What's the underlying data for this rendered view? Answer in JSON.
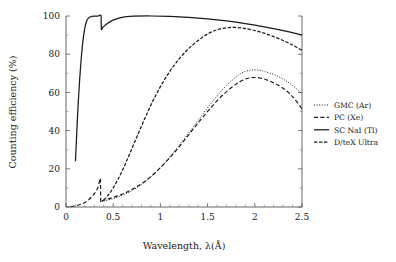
{
  "chart_data": {
    "type": "line",
    "title": "",
    "xlabel": "Wavelength, λ(Å)",
    "ylabel": "Counting efficiency (%)",
    "xlim": [
      0,
      2.5
    ],
    "ylim": [
      0,
      100
    ],
    "xticks": [
      "0",
      "0.5",
      "1",
      "1.5",
      "2",
      "2.5"
    ],
    "xtick_values": [
      0,
      0.5,
      1,
      1.5,
      2,
      2.5
    ],
    "yticks": [
      "0",
      "20",
      "40",
      "60",
      "80",
      "100"
    ],
    "ytick_values": [
      0,
      20,
      40,
      60,
      80,
      100
    ],
    "x_minor_step": 0.1,
    "y_minor_step": 10,
    "grid": false,
    "legend_position": "right-outside",
    "series": [
      {
        "name": "GMC (Ar)",
        "style": "dotted",
        "color": "#1a1a1a",
        "points": [
          [
            0.4,
            3.2
          ],
          [
            0.5,
            4.4
          ],
          [
            0.6,
            6.2
          ],
          [
            0.7,
            8.6
          ],
          [
            0.8,
            11.8
          ],
          [
            0.9,
            15.8
          ],
          [
            1.0,
            20.6
          ],
          [
            1.1,
            26.2
          ],
          [
            1.2,
            32.4
          ],
          [
            1.3,
            38.8
          ],
          [
            1.4,
            45.4
          ],
          [
            1.5,
            52.0
          ],
          [
            1.6,
            58.2
          ],
          [
            1.7,
            63.6
          ],
          [
            1.8,
            68.0
          ],
          [
            1.85,
            69.8
          ],
          [
            1.9,
            71.0
          ],
          [
            1.95,
            71.6
          ],
          [
            2.0,
            71.8
          ],
          [
            2.05,
            71.6
          ],
          [
            2.1,
            71.0
          ],
          [
            2.2,
            69.4
          ],
          [
            2.3,
            67.0
          ],
          [
            2.4,
            63.6
          ],
          [
            2.5,
            59.2
          ]
        ]
      },
      {
        "name": "PC (Xe)",
        "style": "dashed",
        "color": "#1a1a1a",
        "points": [
          [
            0.05,
            0.2
          ],
          [
            0.1,
            0.6
          ],
          [
            0.15,
            1.3
          ],
          [
            0.2,
            2.4
          ],
          [
            0.25,
            4.2
          ],
          [
            0.3,
            7.0
          ],
          [
            0.34,
            10.4
          ],
          [
            0.365,
            14.8
          ],
          [
            0.368,
            3.0
          ],
          [
            0.4,
            3.6
          ],
          [
            0.5,
            5.0
          ],
          [
            0.6,
            6.8
          ],
          [
            0.7,
            9.2
          ],
          [
            0.8,
            12.2
          ],
          [
            0.9,
            16.0
          ],
          [
            1.0,
            20.6
          ],
          [
            1.1,
            25.8
          ],
          [
            1.2,
            31.6
          ],
          [
            1.3,
            37.8
          ],
          [
            1.4,
            44.0
          ],
          [
            1.5,
            50.0
          ],
          [
            1.6,
            55.6
          ],
          [
            1.7,
            60.4
          ],
          [
            1.8,
            64.2
          ],
          [
            1.85,
            65.8
          ],
          [
            1.9,
            67.0
          ],
          [
            1.95,
            67.6
          ],
          [
            2.0,
            67.8
          ],
          [
            2.05,
            67.6
          ],
          [
            2.1,
            67.0
          ],
          [
            2.2,
            65.0
          ],
          [
            2.3,
            62.2
          ],
          [
            2.4,
            57.8
          ],
          [
            2.5,
            51.4
          ]
        ]
      },
      {
        "name": "SC NaI (Tl)",
        "style": "solid",
        "color": "#1a1a1a",
        "points": [
          [
            0.1,
            24.0
          ],
          [
            0.115,
            40.0
          ],
          [
            0.13,
            55.0
          ],
          [
            0.145,
            67.0
          ],
          [
            0.16,
            77.0
          ],
          [
            0.175,
            85.0
          ],
          [
            0.19,
            91.0
          ],
          [
            0.205,
            95.0
          ],
          [
            0.22,
            97.5
          ],
          [
            0.24,
            99.0
          ],
          [
            0.26,
            99.6
          ],
          [
            0.3,
            99.9
          ],
          [
            0.34,
            100.0
          ],
          [
            0.372,
            100.0
          ],
          [
            0.374,
            93.2
          ],
          [
            0.39,
            94.0
          ],
          [
            0.42,
            95.4
          ],
          [
            0.46,
            96.8
          ],
          [
            0.52,
            98.2
          ],
          [
            0.58,
            99.2
          ],
          [
            0.64,
            99.7
          ],
          [
            0.72,
            99.9
          ],
          [
            0.9,
            100.0
          ],
          [
            1.1,
            99.8
          ],
          [
            1.3,
            99.3
          ],
          [
            1.5,
            98.5
          ],
          [
            1.7,
            97.4
          ],
          [
            1.9,
            96.0
          ],
          [
            2.1,
            94.3
          ],
          [
            2.3,
            92.3
          ],
          [
            2.5,
            90.0
          ]
        ]
      },
      {
        "name": "D/teX Ultra",
        "style": "dashdot",
        "color": "#1a1a1a",
        "points": [
          [
            0.4,
            3.6
          ],
          [
            0.45,
            6.4
          ],
          [
            0.5,
            10.0
          ],
          [
            0.55,
            14.4
          ],
          [
            0.6,
            19.4
          ],
          [
            0.65,
            25.0
          ],
          [
            0.7,
            30.8
          ],
          [
            0.75,
            36.6
          ],
          [
            0.8,
            42.4
          ],
          [
            0.85,
            48.0
          ],
          [
            0.9,
            53.4
          ],
          [
            0.95,
            58.4
          ],
          [
            1.0,
            63.0
          ],
          [
            1.05,
            67.2
          ],
          [
            1.1,
            71.0
          ],
          [
            1.15,
            74.4
          ],
          [
            1.2,
            77.6
          ],
          [
            1.25,
            80.4
          ],
          [
            1.3,
            83.0
          ],
          [
            1.35,
            85.2
          ],
          [
            1.4,
            87.2
          ],
          [
            1.45,
            89.0
          ],
          [
            1.5,
            90.6
          ],
          [
            1.55,
            91.8
          ],
          [
            1.6,
            92.8
          ],
          [
            1.65,
            93.4
          ],
          [
            1.7,
            93.8
          ],
          [
            1.75,
            94.0
          ],
          [
            1.8,
            94.0
          ],
          [
            1.85,
            93.8
          ],
          [
            1.9,
            93.4
          ],
          [
            2.0,
            92.4
          ],
          [
            2.1,
            91.0
          ],
          [
            2.2,
            89.2
          ],
          [
            2.3,
            87.2
          ],
          [
            2.4,
            84.8
          ],
          [
            2.5,
            82.0
          ]
        ]
      }
    ]
  },
  "legend": {
    "entries": [
      {
        "label": "GMC (Ar)",
        "style": "dotted"
      },
      {
        "label": "PC (Xe)",
        "style": "dashed"
      },
      {
        "label": "SC NaI (Tl)",
        "style": "solid"
      },
      {
        "label": "D/teX Ultra",
        "style": "dashdot"
      }
    ]
  }
}
